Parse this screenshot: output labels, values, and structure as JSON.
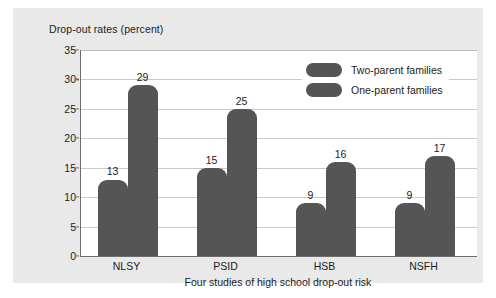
{
  "chart_data": {
    "type": "bar",
    "title": "",
    "xlabel": "Four studies of high school drop-out risk",
    "ylabel": "Drop-out rates (percent)",
    "categories": [
      "NLSY",
      "PSID",
      "HSB",
      "NSFH"
    ],
    "series": [
      {
        "name": "Two-parent families",
        "values": [
          13,
          15,
          9,
          9
        ],
        "color": "#555555"
      },
      {
        "name": "One-parent families",
        "values": [
          29,
          25,
          16,
          17
        ],
        "color": "#555555"
      }
    ],
    "ylim": [
      0,
      35
    ],
    "ytick_labels": [
      "0",
      "5",
      "10",
      "15",
      "20",
      "25",
      "30",
      "35"
    ],
    "ytick_values": [
      0,
      5,
      10,
      15,
      20,
      25,
      30,
      35
    ],
    "grid": true,
    "legend_position": "top-right",
    "data_labels": [
      "13",
      "29",
      "15",
      "25",
      "9",
      "16",
      "9",
      "17"
    ]
  },
  "legend": {
    "items": [
      {
        "label": "Two-parent families"
      },
      {
        "label": "One-parent families"
      }
    ]
  },
  "colors": {
    "bar": "#555555",
    "card_background": "#e9e9e9",
    "plot_background": "#ffffff",
    "gridline": "#c9c9c9",
    "axis": "#6d6d6d",
    "text": "#1b1b1b"
  }
}
